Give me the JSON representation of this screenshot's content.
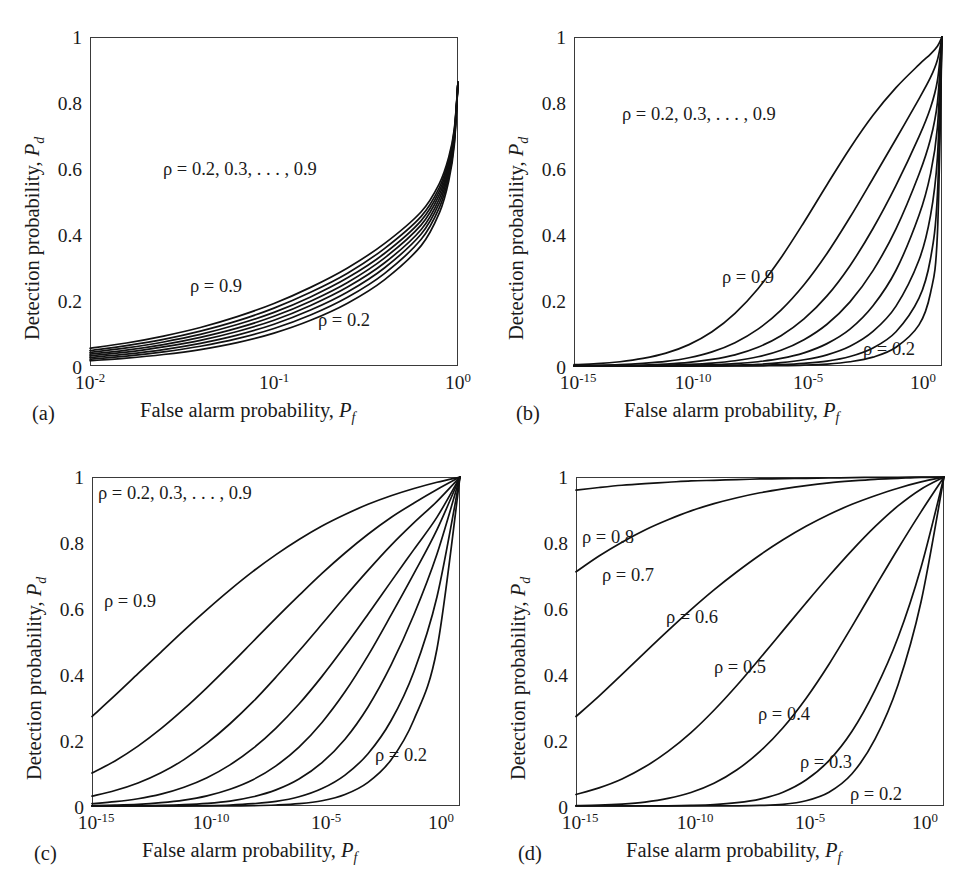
{
  "figure": {
    "axis_x_title_plain": "False alarm probability, ",
    "axis_x_title_sym": "P",
    "axis_x_title_sub": "f",
    "axis_y_title_plain": "Detection probability, ",
    "axis_y_title_sym": "P",
    "axis_y_title_sub": "d",
    "y_ticks": [
      "0",
      "0.2",
      "0.4",
      "0.6",
      "0.8",
      "1"
    ],
    "y_tick_values": [
      0,
      0.2,
      0.4,
      0.6,
      0.8,
      1
    ]
  },
  "panels": [
    {
      "tag": "(a)",
      "x_ticks": [
        "10",
        "10",
        "10"
      ],
      "x_tick_exps": [
        "-2",
        "-1",
        "0"
      ],
      "x_tick_values": [
        -2,
        -1,
        0
      ],
      "annotations": [
        {
          "name": "rho-range-label",
          "text": "ρ = 0.2, 0.3, . . . , 0.9"
        },
        {
          "name": "rho-09-label",
          "text": "ρ = 0.9"
        },
        {
          "name": "rho-02-label",
          "text": "ρ = 0.2"
        }
      ]
    },
    {
      "tag": "(b)",
      "x_ticks": [
        "10",
        "10",
        "10",
        "10"
      ],
      "x_tick_exps": [
        "-15",
        "-10",
        "-5",
        "0"
      ],
      "x_tick_values": [
        -15,
        -10,
        -5,
        0
      ],
      "annotations": [
        {
          "name": "rho-range-label",
          "text": "ρ = 0.2, 0.3, . . . , 0.9"
        },
        {
          "name": "rho-09-label",
          "text": "ρ = 0.9"
        },
        {
          "name": "rho-02-label",
          "text": "ρ = 0.2"
        }
      ]
    },
    {
      "tag": "(c)",
      "x_ticks": [
        "10",
        "10",
        "10",
        "10"
      ],
      "x_tick_exps": [
        "-15",
        "-10",
        "-5",
        "0"
      ],
      "x_tick_values": [
        -15,
        -10,
        -5,
        0
      ],
      "annotations": [
        {
          "name": "rho-range-label",
          "text": "ρ = 0.2, 0.3, . . . , 0.9"
        },
        {
          "name": "rho-09-label",
          "text": "ρ = 0.9"
        },
        {
          "name": "rho-02-label",
          "text": "ρ = 0.2"
        }
      ]
    },
    {
      "tag": "(d)",
      "x_ticks": [
        "10",
        "10",
        "10",
        "10"
      ],
      "x_tick_exps": [
        "-15",
        "-10",
        "-5",
        "0"
      ],
      "x_tick_values": [
        -15,
        -10,
        -5,
        0
      ],
      "annotations": [
        {
          "name": "rho-08-label",
          "text": "ρ = 0.8"
        },
        {
          "name": "rho-07-label",
          "text": "ρ = 0.7"
        },
        {
          "name": "rho-06-label",
          "text": "ρ = 0.6"
        },
        {
          "name": "rho-05-label",
          "text": "ρ = 0.5"
        },
        {
          "name": "rho-04-label",
          "text": "ρ = 0.4"
        },
        {
          "name": "rho-03-label",
          "text": "ρ = 0.3"
        },
        {
          "name": "rho-02-label",
          "text": "ρ = 0.2"
        }
      ]
    }
  ],
  "chart_data": [
    {
      "type": "line",
      "panel": "(a)",
      "title": "",
      "xlabel": "False alarm probability, P_f",
      "ylabel": "Detection probability, P_d",
      "xscale": "log",
      "xlim": [
        0.01,
        1.0
      ],
      "ylim": [
        0,
        1
      ],
      "grid": false,
      "legend": "inline-annotations",
      "x": [
        0.01,
        0.0158,
        0.0251,
        0.0398,
        0.0631,
        0.1,
        0.158,
        0.251,
        0.398,
        0.631,
        0.794,
        0.891,
        0.955,
        1.0
      ],
      "series": [
        {
          "name": "ρ = 0.2",
          "values": [
            0.016,
            0.024,
            0.035,
            0.05,
            0.071,
            0.1,
            0.139,
            0.191,
            0.262,
            0.366,
            0.467,
            0.563,
            0.672,
            0.862
          ]
        },
        {
          "name": "ρ = 0.3",
          "values": [
            0.021,
            0.03,
            0.043,
            0.06,
            0.083,
            0.114,
            0.155,
            0.209,
            0.281,
            0.385,
            0.483,
            0.576,
            0.681,
            0.862
          ]
        },
        {
          "name": "ρ = 0.4",
          "values": [
            0.026,
            0.036,
            0.05,
            0.069,
            0.094,
            0.127,
            0.17,
            0.225,
            0.298,
            0.401,
            0.497,
            0.588,
            0.689,
            0.862
          ]
        },
        {
          "name": "ρ = 0.5",
          "values": [
            0.031,
            0.042,
            0.058,
            0.078,
            0.105,
            0.139,
            0.184,
            0.24,
            0.313,
            0.415,
            0.51,
            0.598,
            0.696,
            0.862
          ]
        },
        {
          "name": "ρ = 0.6",
          "values": [
            0.036,
            0.048,
            0.065,
            0.087,
            0.115,
            0.151,
            0.197,
            0.254,
            0.328,
            0.429,
            0.522,
            0.608,
            0.703,
            0.862
          ]
        },
        {
          "name": "ρ = 0.7",
          "values": [
            0.041,
            0.055,
            0.073,
            0.096,
            0.126,
            0.163,
            0.21,
            0.268,
            0.342,
            0.442,
            0.533,
            0.617,
            0.709,
            0.862
          ]
        },
        {
          "name": "ρ = 0.8",
          "values": [
            0.047,
            0.062,
            0.081,
            0.106,
            0.137,
            0.176,
            0.224,
            0.282,
            0.357,
            0.455,
            0.544,
            0.626,
            0.715,
            0.862
          ]
        },
        {
          "name": "ρ = 0.9",
          "values": [
            0.054,
            0.07,
            0.091,
            0.117,
            0.15,
            0.19,
            0.239,
            0.298,
            0.372,
            0.469,
            0.556,
            0.635,
            0.721,
            0.862
          ]
        }
      ]
    },
    {
      "type": "line",
      "panel": "(b)",
      "title": "",
      "xlabel": "False alarm probability, P_f",
      "ylabel": "Detection probability, P_d",
      "xscale": "log",
      "xlim": [
        1e-16,
        1.0
      ],
      "ylim": [
        0,
        1
      ],
      "grid": false,
      "legend": "inline-annotations",
      "x_log10": [
        -16,
        -15,
        -14,
        -13,
        -12,
        -11,
        -10,
        -9,
        -8,
        -7,
        -6,
        -5,
        -4,
        -3,
        -2,
        -1,
        -0.5,
        -0.2,
        0
      ],
      "series": [
        {
          "name": "ρ = 0.9",
          "values": [
            0.004,
            0.007,
            0.013,
            0.023,
            0.039,
            0.065,
            0.104,
            0.16,
            0.235,
            0.329,
            0.437,
            0.551,
            0.662,
            0.762,
            0.846,
            0.916,
            0.948,
            0.972,
            1.0
          ]
        },
        {
          "name": "ρ = 0.8",
          "values": [
            0.001,
            0.002,
            0.004,
            0.008,
            0.014,
            0.025,
            0.043,
            0.071,
            0.112,
            0.17,
            0.247,
            0.342,
            0.452,
            0.57,
            0.69,
            0.812,
            0.877,
            0.93,
            1.0
          ]
        },
        {
          "name": "ρ = 0.7",
          "values": [
            0.0005,
            0.001,
            0.002,
            0.003,
            0.006,
            0.011,
            0.02,
            0.034,
            0.057,
            0.092,
            0.143,
            0.213,
            0.305,
            0.418,
            0.549,
            0.697,
            0.785,
            0.867,
            1.0
          ]
        },
        {
          "name": "ρ = 0.6",
          "values": [
            0.0002,
            0.0004,
            0.0007,
            0.0013,
            0.0025,
            0.005,
            0.009,
            0.016,
            0.028,
            0.048,
            0.08,
            0.127,
            0.195,
            0.29,
            0.417,
            0.583,
            0.69,
            0.8,
            1.0
          ]
        },
        {
          "name": "ρ = 0.5",
          "values": [
            5e-05,
            0.0001,
            0.0002,
            0.0005,
            0.001,
            0.002,
            0.004,
            0.007,
            0.013,
            0.023,
            0.04,
            0.068,
            0.112,
            0.183,
            0.291,
            0.458,
            0.584,
            0.725,
            1.0
          ]
        },
        {
          "name": "ρ = 0.4",
          "values": [
            1e-05,
            3e-05,
            6e-05,
            0.00013,
            0.0003,
            0.0006,
            0.0013,
            0.0026,
            0.005,
            0.01,
            0.019,
            0.034,
            0.06,
            0.105,
            0.182,
            0.322,
            0.457,
            0.633,
            1.0
          ]
        },
        {
          "name": "ρ = 0.3",
          "values": [
            2e-06,
            5e-06,
            1e-05,
            3e-05,
            7e-05,
            0.00016,
            0.0004,
            0.0008,
            0.0018,
            0.004,
            0.008,
            0.015,
            0.029,
            0.055,
            0.104,
            0.206,
            0.326,
            0.52,
            1.0
          ]
        },
        {
          "name": "ρ = 0.2",
          "values": [
            2e-07,
            6e-07,
            2e-06,
            5e-06,
            1e-05,
            3e-05,
            8e-05,
            0.0002,
            0.0005,
            0.0012,
            0.0028,
            0.006,
            0.013,
            0.027,
            0.057,
            0.125,
            0.222,
            0.4,
            1.0
          ]
        }
      ]
    },
    {
      "type": "line",
      "panel": "(c)",
      "title": "",
      "xlabel": "False alarm probability, P_f",
      "ylabel": "Detection probability, P_d",
      "xscale": "log",
      "xlim": [
        1e-16,
        1.0
      ],
      "ylim": [
        0,
        1
      ],
      "grid": false,
      "legend": "inline-annotations",
      "x_log10": [
        -16,
        -15,
        -14,
        -13,
        -12,
        -11,
        -10,
        -9,
        -8,
        -7,
        -6,
        -5,
        -4,
        -3,
        -2,
        -1,
        0
      ],
      "series": [
        {
          "name": "ρ = 0.9",
          "values": [
            0.272,
            0.336,
            0.402,
            0.468,
            0.534,
            0.597,
            0.657,
            0.713,
            0.764,
            0.81,
            0.851,
            0.886,
            0.917,
            0.943,
            0.965,
            0.984,
            1.0
          ]
        },
        {
          "name": "ρ = 0.8",
          "values": [
            0.1,
            0.137,
            0.182,
            0.235,
            0.295,
            0.36,
            0.429,
            0.5,
            0.571,
            0.64,
            0.707,
            0.769,
            0.826,
            0.877,
            0.921,
            0.962,
            1.0
          ]
        },
        {
          "name": "ρ = 0.7",
          "values": [
            0.03,
            0.047,
            0.07,
            0.101,
            0.141,
            0.191,
            0.25,
            0.317,
            0.392,
            0.471,
            0.553,
            0.636,
            0.716,
            0.792,
            0.861,
            0.926,
            1.0
          ]
        },
        {
          "name": "ρ = 0.6",
          "values": [
            0.007,
            0.013,
            0.022,
            0.036,
            0.057,
            0.086,
            0.125,
            0.175,
            0.237,
            0.31,
            0.394,
            0.486,
            0.583,
            0.682,
            0.78,
            0.878,
            1.0
          ]
        },
        {
          "name": "ρ = 0.5",
          "values": [
            0.0012,
            0.0026,
            0.005,
            0.01,
            0.018,
            0.031,
            0.051,
            0.08,
            0.122,
            0.179,
            0.254,
            0.347,
            0.457,
            0.58,
            0.707,
            0.84,
            1.0
          ]
        },
        {
          "name": "ρ = 0.4",
          "values": [
            0.00012,
            0.0003,
            0.0008,
            0.0018,
            0.004,
            0.008,
            0.015,
            0.028,
            0.049,
            0.082,
            0.132,
            0.203,
            0.301,
            0.428,
            0.582,
            0.766,
            1.0
          ]
        },
        {
          "name": "ρ = 0.3",
          "values": [
            8e-06,
            2e-05,
            6e-05,
            0.00018,
            0.0005,
            0.0012,
            0.003,
            0.007,
            0.014,
            0.028,
            0.053,
            0.094,
            0.159,
            0.259,
            0.409,
            0.636,
            1.0
          ]
        },
        {
          "name": "ρ = 0.2",
          "values": [
            2e-07,
            8e-07,
            3e-06,
            1e-05,
            4e-05,
            0.00012,
            0.0004,
            0.0011,
            0.003,
            0.007,
            0.016,
            0.035,
            0.072,
            0.14,
            0.263,
            0.478,
            1.0
          ]
        }
      ]
    },
    {
      "type": "line",
      "panel": "(d)",
      "title": "",
      "xlabel": "False alarm probability, P_f",
      "ylabel": "Detection probability, P_d",
      "xscale": "log",
      "xlim": [
        1e-16,
        1.0
      ],
      "ylim": [
        0,
        1
      ],
      "grid": false,
      "legend": "inline-annotations",
      "x_log10": [
        -16,
        -15,
        -14,
        -13,
        -12,
        -11,
        -10,
        -9,
        -8,
        -7,
        -6,
        -5,
        -4,
        -3,
        -2,
        -1,
        0
      ],
      "series": [
        {
          "name": "ρ = 0.8",
          "values": [
            0.96,
            0.968,
            0.975,
            0.98,
            0.984,
            0.988,
            0.99,
            0.992,
            0.994,
            0.995,
            0.996,
            0.997,
            0.998,
            0.999,
            0.999,
            1.0,
            1.0
          ]
        },
        {
          "name": "ρ = 0.7",
          "values": [
            0.712,
            0.76,
            0.802,
            0.839,
            0.87,
            0.897,
            0.919,
            0.937,
            0.952,
            0.964,
            0.974,
            0.982,
            0.988,
            0.993,
            0.996,
            0.999,
            1.0
          ]
        },
        {
          "name": "ρ = 0.6",
          "values": [
            0.272,
            0.334,
            0.4,
            0.467,
            0.533,
            0.597,
            0.657,
            0.712,
            0.763,
            0.809,
            0.85,
            0.886,
            0.917,
            0.943,
            0.966,
            0.985,
            1.0
          ]
        },
        {
          "name": "ρ = 0.5",
          "values": [
            0.035,
            0.055,
            0.082,
            0.119,
            0.166,
            0.223,
            0.291,
            0.367,
            0.449,
            0.533,
            0.617,
            0.699,
            0.777,
            0.849,
            0.912,
            0.963,
            1.0
          ]
        },
        {
          "name": "ρ = 0.4",
          "values": [
            0.0012,
            0.0026,
            0.006,
            0.012,
            0.023,
            0.041,
            0.069,
            0.11,
            0.166,
            0.238,
            0.327,
            0.431,
            0.546,
            0.665,
            0.782,
            0.894,
            1.0
          ]
        },
        {
          "name": "ρ = 0.3",
          "values": [
            6e-06,
            2e-05,
            7e-05,
            0.0002,
            0.0006,
            0.0016,
            0.004,
            0.01,
            0.021,
            0.042,
            0.079,
            0.138,
            0.227,
            0.352,
            0.512,
            0.725,
            1.0
          ]
        },
        {
          "name": "ρ = 0.2",
          "values": [
            0.0,
            0.0,
            1e-07,
            7e-07,
            4e-06,
            2e-05,
            0.0001,
            0.0004,
            0.0016,
            0.005,
            0.016,
            0.042,
            0.098,
            0.203,
            0.368,
            0.62,
            1.0
          ]
        }
      ]
    }
  ]
}
